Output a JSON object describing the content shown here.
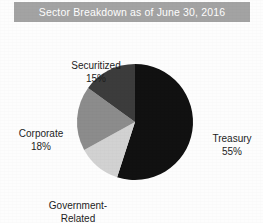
{
  "title": {
    "text": "Sector Breakdown as of June 30, 2016",
    "bar_color": "#a3a3a3",
    "text_color": "#ffffff"
  },
  "background_color": "#fdfdfd",
  "chart_data": {
    "type": "pie",
    "title": "Sector Breakdown as of June 30, 2016",
    "xlabel": "",
    "ylabel": "",
    "unit": "%",
    "start_angle": 0,
    "direction": "clockwise",
    "legend": "none (direct labels outside slices)",
    "grid": false,
    "categories": [
      "Treasury",
      "Government-Related",
      "Corporate",
      "Securitized"
    ],
    "values": [
      55,
      12,
      18,
      15
    ],
    "slices": [
      {
        "label": "Treasury",
        "label_line2": "",
        "value": 55,
        "value_text": "55%",
        "color": "#111111",
        "label_position": "right"
      },
      {
        "label": "Government-",
        "label_line2": "Related",
        "value": 12,
        "value_text": "12%",
        "color": "#d2d2d2",
        "label_position": "bottom"
      },
      {
        "label": "Corporate",
        "label_line2": "",
        "value": 18,
        "value_text": "18%",
        "color": "#8c8c8c",
        "label_position": "left"
      },
      {
        "label": "Securitized",
        "label_line2": "",
        "value": 15,
        "value_text": "15%",
        "color": "#3c3c3c",
        "label_position": "top"
      }
    ]
  },
  "labels": {
    "securitized": {
      "name": "Securitized",
      "value": "15%"
    },
    "corporate": {
      "name": "Corporate",
      "value": "18%"
    },
    "government": {
      "name": "Government-",
      "name2": "Related",
      "value": "12%"
    },
    "treasury": {
      "name": "Treasury",
      "value": "55%"
    }
  }
}
